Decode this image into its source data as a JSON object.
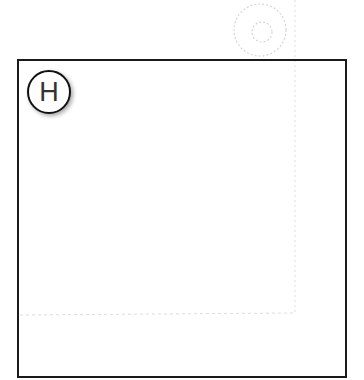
{
  "badge": {
    "label": "H"
  },
  "colors": {
    "frame_border": "#1a1a1a",
    "badge_border": "#111111",
    "badge_text": "#333333",
    "ghost_marks": "#cfcfcf"
  }
}
